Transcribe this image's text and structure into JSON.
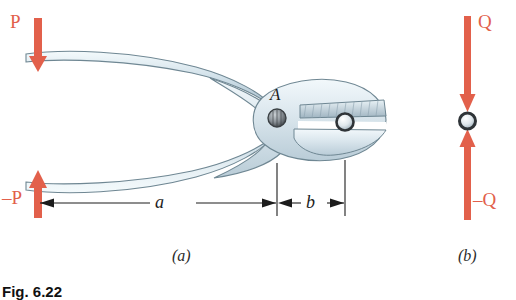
{
  "figure": {
    "caption": "Fig. 6.22",
    "panel_a_label": "(a)",
    "panel_b_label": "(b)",
    "colors": {
      "force_arrow": "#e2604b",
      "tool_body_fill": "#dde8ee",
      "tool_body_stroke": "#6f8793",
      "dimension_line": "#1c1c1c",
      "pivot_dark": "#4a4f53",
      "background": "#ffffff"
    }
  },
  "panel_a": {
    "name": "pliers-free-body-diagram",
    "forces": [
      {
        "label": "P",
        "direction": "down",
        "icon": "down-arrow-icon"
      },
      {
        "label": "–P",
        "direction": "up",
        "icon": "up-arrow-icon"
      }
    ],
    "points": [
      {
        "label": "A",
        "role": "pivot-pin"
      }
    ],
    "dimensions": [
      {
        "label": "a",
        "span": "handle-to-pivot"
      },
      {
        "label": "b",
        "span": "pivot-to-jaw"
      }
    ]
  },
  "panel_b": {
    "name": "gripped-object-free-body-diagram",
    "forces": [
      {
        "label": "Q",
        "direction": "down",
        "icon": "down-arrow-icon"
      },
      {
        "label": "–Q",
        "direction": "up",
        "icon": "up-arrow-icon"
      }
    ],
    "points": [
      {
        "label": "",
        "role": "gripped-object"
      }
    ]
  }
}
